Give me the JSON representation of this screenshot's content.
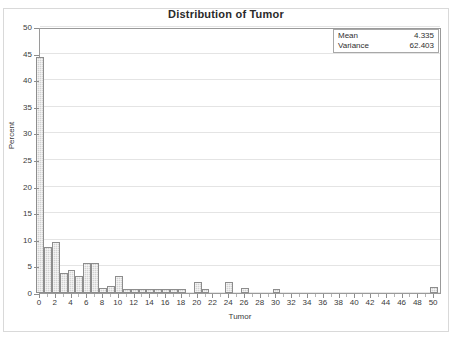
{
  "chart_data": {
    "type": "bar",
    "title": "Distribution of Tumor",
    "xlabel": "Tumor",
    "ylabel": "Percent",
    "xlim": [
      0,
      51
    ],
    "ylim": [
      0,
      50
    ],
    "grid": true,
    "y_ticks": [
      0,
      5,
      10,
      15,
      20,
      25,
      30,
      35,
      40,
      45,
      50
    ],
    "x_ticks": [
      0,
      2,
      4,
      6,
      8,
      10,
      12,
      14,
      16,
      18,
      20,
      22,
      24,
      26,
      28,
      30,
      32,
      34,
      36,
      38,
      40,
      42,
      44,
      46,
      48,
      50
    ],
    "bar_width": 1,
    "x": [
      0,
      1,
      2,
      3,
      4,
      5,
      6,
      7,
      8,
      9,
      10,
      11,
      12,
      13,
      14,
      15,
      16,
      17,
      18,
      20,
      21,
      24,
      26,
      30,
      50
    ],
    "values": [
      44.3,
      8.6,
      9.5,
      3.8,
      4.4,
      3.2,
      5.6,
      5.6,
      0.9,
      1.4,
      3.2,
      0.8,
      0.8,
      0.8,
      0.8,
      0.8,
      0.8,
      0.8,
      0.8,
      2.1,
      0.7,
      2.1,
      0.9,
      0.7,
      1.2
    ],
    "categories": [
      "0",
      "1",
      "2",
      "3",
      "4",
      "5",
      "6",
      "7",
      "8",
      "9",
      "10",
      "11",
      "12",
      "13",
      "14",
      "15",
      "16",
      "17",
      "18",
      "20",
      "21",
      "24",
      "26",
      "30",
      "50"
    ],
    "series": [
      {
        "name": "Percent",
        "values": [
          44.3,
          8.6,
          9.5,
          3.8,
          4.4,
          3.2,
          5.6,
          5.6,
          0.9,
          1.4,
          3.2,
          0.8,
          0.8,
          0.8,
          0.8,
          0.8,
          0.8,
          0.8,
          0.8,
          2.1,
          0.7,
          2.1,
          0.9,
          0.7,
          1.2
        ]
      }
    ],
    "annotations": [
      {
        "key": "Mean",
        "value": "4.335"
      },
      {
        "key": "Variance",
        "value": "62.403"
      }
    ],
    "colors": {
      "bar_fill": "#d2d2d2",
      "bar_border": "#8d8d8d",
      "grid": "#e4e4e4",
      "axis": "#9a9a9a",
      "text": "#3a3a3a",
      "title": "#2a2a2a",
      "background": "#ffffff"
    }
  },
  "stats": {
    "mean_label": "Mean",
    "mean_value": "4.335",
    "variance_label": "Variance",
    "variance_value": "62.403"
  }
}
